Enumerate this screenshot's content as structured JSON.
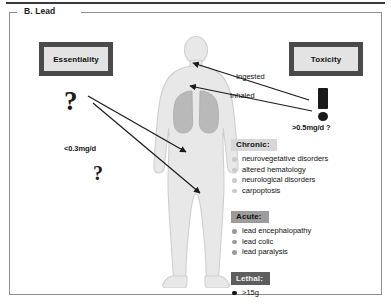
{
  "panel": {
    "legend": "B. Lead"
  },
  "boxes": {
    "essentiality": "Essentiality",
    "toxicity": "Toxicity"
  },
  "glyphs": {
    "question_left_top": "?",
    "question_left_bottom": "?",
    "exclamation": "!"
  },
  "doses": {
    "essential": "<0.3mg/d",
    "toxic": ">0.5mg/d ?"
  },
  "arrow_labels": {
    "ingested": "Ingested",
    "inhaled": "Inhaled"
  },
  "effects": [
    {
      "heading": "Chronic:",
      "items": [
        "neurovegetative disorders",
        "altered hematology",
        "neurological disorders",
        "carpoptosis"
      ]
    },
    {
      "heading": "Acute:",
      "items": [
        "lead encephalopathy",
        "lead colic",
        "lead paralysis"
      ]
    },
    {
      "heading": "Lethal:",
      "items": [
        ">15g"
      ]
    }
  ],
  "colors": {
    "box_border": "#4a4a4a",
    "box_fill": "#e3e3e3",
    "chronic_band": "#d7d7d7",
    "acute_band": "#9c9c9c",
    "lethal_band": "#5e5e5e",
    "body_fill": "#e8e8e8",
    "lung_fill": "#b9b9b9",
    "panel_border": "#8d8f91"
  }
}
